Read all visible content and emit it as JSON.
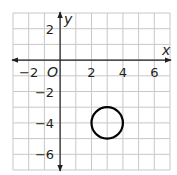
{
  "diagram": {
    "type": "coordinate-plane",
    "x_range": [
      -3,
      7
    ],
    "y_range": [
      -7,
      3
    ],
    "axis_labels": {
      "x": "x",
      "y": "y"
    },
    "origin_label": "O",
    "x_ticks": [
      {
        "value": -2,
        "label": "−2"
      },
      {
        "value": 2,
        "label": "2"
      },
      {
        "value": 4,
        "label": "4"
      },
      {
        "value": 6,
        "label": "6"
      }
    ],
    "y_ticks": [
      {
        "value": 2,
        "label": "2"
      },
      {
        "value": -2,
        "label": "−2"
      },
      {
        "value": -4,
        "label": "−4"
      },
      {
        "value": -6,
        "label": "−6"
      }
    ],
    "circle": {
      "center": [
        3,
        -4
      ],
      "radius": 1
    },
    "colors": {
      "grid": "#c8c8c8",
      "axis": "#231f20",
      "circle": "#000000"
    }
  }
}
